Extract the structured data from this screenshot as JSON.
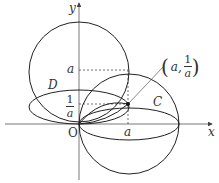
{
  "labels": {
    "y_axis": "y",
    "x_axis": "x",
    "origin": "O",
    "y_tick_a": "a",
    "y_tick_inv_num": "1",
    "y_tick_inv_den": "a",
    "x_tick_a": "a",
    "curve_d": "D",
    "curve_c": "C",
    "point_open": "(",
    "point_x": "a,",
    "point_num": "1",
    "point_den": "a",
    "point_close": ")"
  },
  "colors": {
    "stroke": "#222222",
    "axis": "#444444"
  }
}
